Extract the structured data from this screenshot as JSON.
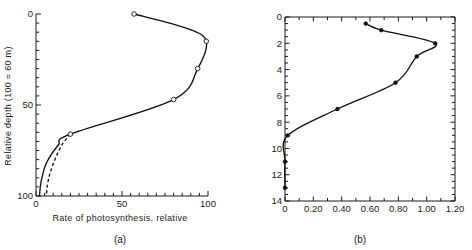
{
  "figure": {
    "background": "#ffffff",
    "ink_color": "#111111"
  },
  "panels": [
    {
      "id": "a",
      "caption": "(a)",
      "xlabel": "Rate of photosynthesis, relative",
      "ylabel": "Relative depth (100 = 60 m)",
      "x_ticks": [
        "0",
        "50",
        "100"
      ],
      "y_ticks": [
        "0",
        "50",
        "100"
      ]
    },
    {
      "id": "b",
      "caption": "(b)",
      "xlabel": "",
      "ylabel": "",
      "x_ticks": [
        "0",
        "0.20",
        "0.40",
        "0.60",
        "0.80",
        "1.00",
        "1.20"
      ],
      "y_ticks": [
        "0",
        "2",
        "4",
        "6",
        "8",
        "10",
        "12",
        "14"
      ]
    }
  ],
  "chart_data": [
    {
      "type": "line",
      "panel": "a",
      "title": "",
      "xlabel": "Rate of photosynthesis, relative",
      "ylabel": "Relative depth (100 = 60 m)",
      "xlim": [
        0,
        100
      ],
      "ylim": [
        0,
        100
      ],
      "y_inverted": true,
      "grid": false,
      "legend": "none",
      "x_ticks": [
        0,
        50,
        100
      ],
      "y_ticks": [
        0,
        50,
        100
      ],
      "x_minor_tick_step": 5,
      "y_minor_tick_step": 5,
      "series": [
        {
          "name": "measured profile (solid)",
          "style": "solid",
          "marker": "open-circle",
          "x": [
            57,
            88,
            99,
            94,
            80,
            20,
            13,
            6,
            3,
            2
          ],
          "y": [
            0,
            8,
            15,
            30,
            47,
            66,
            72,
            82,
            92,
            100
          ]
        },
        {
          "name": "alternate profile (dashed)",
          "style": "dashed",
          "marker": "none",
          "x": [
            20,
            15,
            11,
            8,
            6.5,
            6
          ],
          "y": [
            66,
            72,
            80,
            88,
            95,
            100
          ]
        }
      ],
      "markers": [
        {
          "x": 57,
          "y": 0
        },
        {
          "x": 99,
          "y": 15
        },
        {
          "x": 94,
          "y": 30
        },
        {
          "x": 80,
          "y": 47
        },
        {
          "x": 20,
          "y": 66
        }
      ]
    },
    {
      "type": "line",
      "panel": "b",
      "title": "",
      "xlabel": "",
      "ylabel": "",
      "xlim": [
        0,
        1.2
      ],
      "ylim": [
        0,
        14
      ],
      "y_inverted": true,
      "grid": false,
      "legend": "none",
      "x_ticks": [
        0,
        0.2,
        0.4,
        0.6,
        0.8,
        1.0,
        1.2
      ],
      "y_ticks": [
        0,
        2,
        4,
        6,
        8,
        10,
        12,
        14
      ],
      "x_minor_tick_step": 0.1,
      "y_minor_tick_step": 0.5,
      "series": [
        {
          "name": "depth profile",
          "style": "solid",
          "marker": "filled-circle",
          "x": [
            0.57,
            0.68,
            1.06,
            0.93,
            0.78,
            0.37,
            0.02,
            0.0,
            0.0
          ],
          "y": [
            0.5,
            1.0,
            2.0,
            3.0,
            5.0,
            7.0,
            9.0,
            11.0,
            13.0
          ]
        }
      ],
      "markers": [
        {
          "x": 0.57,
          "y": 0.5
        },
        {
          "x": 0.68,
          "y": 1.0
        },
        {
          "x": 1.06,
          "y": 2.0
        },
        {
          "x": 0.93,
          "y": 3.0
        },
        {
          "x": 0.78,
          "y": 5.0
        },
        {
          "x": 0.37,
          "y": 7.0
        },
        {
          "x": 0.02,
          "y": 9.0
        },
        {
          "x": 0.0,
          "y": 11.0
        },
        {
          "x": 0.0,
          "y": 13.0
        }
      ]
    }
  ]
}
